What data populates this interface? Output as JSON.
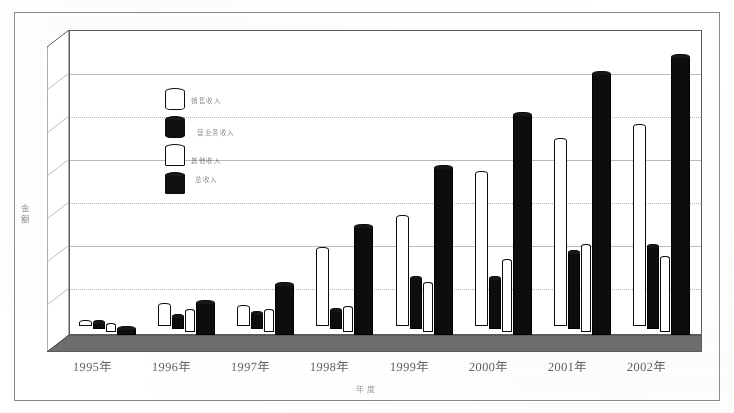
{
  "chart_data": {
    "type": "bar",
    "title": "",
    "subtitle": "",
    "xlabel": "年度",
    "ylabel": "金额",
    "categories": [
      "1995年",
      "1996年",
      "1997年",
      "1998年",
      "1999年",
      "2000年",
      "2001年",
      "2002年"
    ],
    "grid": true,
    "gridline_count": 7,
    "y_tick_labels": [],
    "ylim": [
      0,
      100
    ],
    "legend_position": "inside-top-left",
    "series": [
      {
        "name": "销售收入",
        "marker": "white-cylinder",
        "color": "#ffffff",
        "edge_color": "#111111",
        "values": [
          1,
          7,
          6,
          26,
          37,
          52,
          63,
          68
        ]
      },
      {
        "name": "营业务收入",
        "marker": "black-cylinder",
        "color": "#111111",
        "edge_color": "#000000",
        "values": [
          2,
          4,
          5,
          6,
          17,
          17,
          26,
          28
        ]
      },
      {
        "name": "其他收入",
        "marker": "white-cube",
        "color": "#ffffff",
        "edge_color": "#111111",
        "values": [
          2,
          7,
          7,
          8,
          16,
          24,
          29,
          25
        ]
      },
      {
        "name": "总收入",
        "marker": "black-cube",
        "color": "#111111",
        "edge_color": "#000000",
        "values": [
          2,
          11,
          17,
          37,
          57,
          75,
          89,
          95
        ]
      }
    ]
  },
  "axes": {
    "y_title": "金额",
    "x_title": "年度"
  },
  "legend": {
    "items": [
      {
        "label": "销售收入",
        "swatch": "white-cylinder-icon"
      },
      {
        "label": "营业务收入",
        "swatch": "black-cylinder-icon"
      },
      {
        "label": "其他收入",
        "swatch": "white-cube-icon"
      },
      {
        "label": "总收入",
        "swatch": "black-cube-icon"
      }
    ]
  }
}
